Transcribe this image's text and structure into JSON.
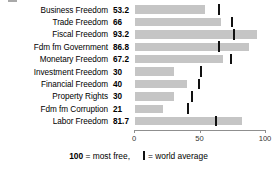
{
  "chart_data": {
    "type": "bar",
    "orientation": "horizontal",
    "title": "",
    "xlabel": "",
    "ylabel": "",
    "xlim": [
      0,
      100
    ],
    "grid": false,
    "axis_ticks": [
      0,
      50,
      100
    ],
    "axis_tick_labels": [
      "0",
      "50",
      "100"
    ],
    "categories": [
      "Business Freedom",
      "Trade Freedom",
      "Fiscal Freedom",
      "Fdm fm Government",
      "Monetary Freedom",
      "Investment Freedom",
      "Financial Freedom",
      "Property Rights",
      "Fdm fm Corruption",
      "Labor Freedom"
    ],
    "values": [
      53.2,
      66,
      93.2,
      86.8,
      67.2,
      30,
      40,
      30,
      21,
      81.7
    ],
    "value_labels": [
      "53.2",
      "66",
      "93.2",
      "86.8",
      "67.2",
      "30",
      "40",
      "30",
      "21",
      "81.7"
    ],
    "series": [
      {
        "name": "Country score",
        "values": [
          53.2,
          66,
          93.2,
          86.8,
          67.2,
          30,
          40,
          30,
          21,
          81.7
        ]
      },
      {
        "name": "world average",
        "marker": "vertical-tick",
        "values": [
          64.3,
          74.4,
          75.4,
          63.9,
          73.3,
          50.3,
          49.0,
          43.8,
          40.5,
          62.1
        ]
      }
    ],
    "bar_color": "#c5c5c5",
    "marker_color": "#111111",
    "legend_position": "bottom"
  },
  "legend": {
    "most_free_value": "100",
    "most_free_text": "= most free,",
    "average_text": "= world average",
    "tick_glyph": "world-average-tick-icon"
  }
}
